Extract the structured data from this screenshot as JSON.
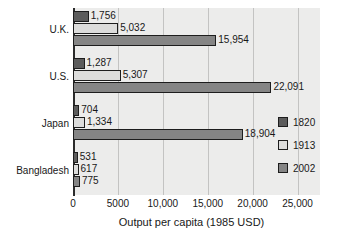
{
  "chart_data": {
    "type": "bar",
    "orientation": "horizontal",
    "title": "",
    "xlabel": "Output per capita (1985 USD)",
    "ylabel": "",
    "xlim": [
      0,
      27500
    ],
    "xticks": [
      0,
      5000,
      10000,
      15000,
      20000,
      25000
    ],
    "xtick_labels": [
      "0",
      "5000",
      "10,000",
      "15,000",
      "20,000",
      "25,000"
    ],
    "grid": true,
    "legend_position": "right",
    "categories": [
      "U.K.",
      "U.S.",
      "Japan",
      "Bangladesh"
    ],
    "series": [
      {
        "name": "1820",
        "color": "#5c5c5c",
        "values": [
          1756,
          1287,
          704,
          531
        ],
        "labels": [
          "1,756",
          "1,287",
          "704",
          "531"
        ]
      },
      {
        "name": "1913",
        "color": "#dcdcdb",
        "values": [
          5032,
          5307,
          1334,
          617
        ],
        "labels": [
          "5,032",
          "5,307",
          "1,334",
          "617"
        ]
      },
      {
        "name": "2002",
        "color": "#858585",
        "values": [
          15954,
          22091,
          18904,
          775
        ],
        "labels": [
          "15,954",
          "22,091",
          "18,904",
          "775"
        ]
      }
    ]
  },
  "legend": {
    "entries": [
      {
        "label": "1820",
        "color": "#5c5c5c"
      },
      {
        "label": "1913",
        "color": "#dcdcdb"
      },
      {
        "label": "2002",
        "color": "#858585"
      }
    ]
  },
  "axis": {
    "x_title": "Output per capita (1985 USD)",
    "tick_labels": [
      "0",
      "5000",
      "10,000",
      "15,000",
      "20,000",
      "25,000"
    ]
  },
  "categories": {
    "labels": [
      "U.K.",
      "U.S.",
      "Japan",
      "Bangladesh"
    ]
  }
}
